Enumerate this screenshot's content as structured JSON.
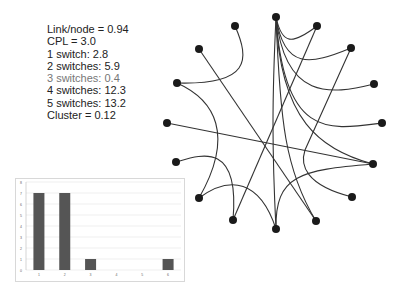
{
  "stats": {
    "lines": [
      "Link/node = 0.94",
      "CPL = 3.0",
      "1 switch: 2.8",
      "2 switches: 5.9",
      "3 switches: 0.4",
      "4 switches: 12.3",
      "5 switches: 13.2",
      "Cluster = 0.12"
    ]
  },
  "network": {
    "node_color": "#1a1a1a",
    "edge_color": "#333333",
    "nodes": [
      {
        "id": "n0",
        "x": 276,
        "y": 17
      },
      {
        "id": "n1",
        "x": 317,
        "y": 26
      },
      {
        "id": "n2",
        "x": 351,
        "y": 48
      },
      {
        "id": "n3",
        "x": 374,
        "y": 84
      },
      {
        "id": "n4",
        "x": 382,
        "y": 123
      },
      {
        "id": "n5",
        "x": 373,
        "y": 164
      },
      {
        "id": "n6",
        "x": 352,
        "y": 197
      },
      {
        "id": "n7",
        "x": 316,
        "y": 221
      },
      {
        "id": "n8",
        "x": 276,
        "y": 229
      },
      {
        "id": "n9",
        "x": 233,
        "y": 220
      },
      {
        "id": "n10",
        "x": 199,
        "y": 198
      },
      {
        "id": "n11",
        "x": 176,
        "y": 162
      },
      {
        "id": "n12",
        "x": 167,
        "y": 123
      },
      {
        "id": "n13",
        "x": 177,
        "y": 83
      },
      {
        "id": "n14",
        "x": 199,
        "y": 49
      },
      {
        "id": "n15",
        "x": 235,
        "y": 26
      }
    ]
  },
  "chart_data": {
    "type": "bar",
    "title": "",
    "xlabel": "",
    "ylabel": "",
    "categories": [
      "1",
      "2",
      "3",
      "4",
      "5",
      "6"
    ],
    "values": [
      7,
      7,
      1,
      0,
      0,
      1
    ],
    "ylim": [
      0,
      8
    ],
    "yticks": [
      "0",
      "1",
      "2",
      "3",
      "4",
      "5",
      "6",
      "7",
      "8"
    ],
    "grid": true,
    "bar_color": "#555555"
  }
}
